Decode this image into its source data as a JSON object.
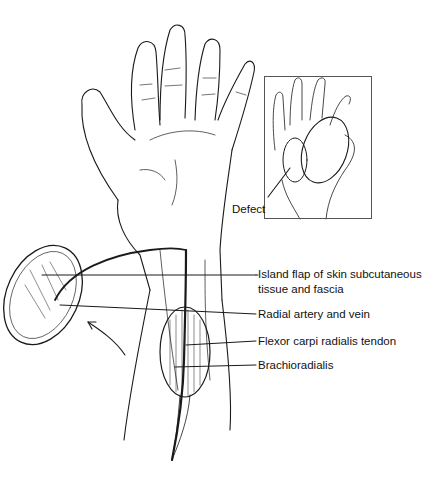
{
  "figure": {
    "inset": {
      "label": "Defect"
    },
    "labels": [
      {
        "id": "island-flap",
        "text": "Island flap of skin subcutaneous tissue and fascia"
      },
      {
        "id": "radial-artery",
        "text": "Radial artery and vein"
      },
      {
        "id": "fcr-tendon",
        "text": "Flexor carpi radialis tendon"
      },
      {
        "id": "brachioradialis",
        "text": "Brachioradialis"
      }
    ]
  },
  "colors": {
    "line": "#1a1a1a",
    "background": "#ffffff"
  }
}
